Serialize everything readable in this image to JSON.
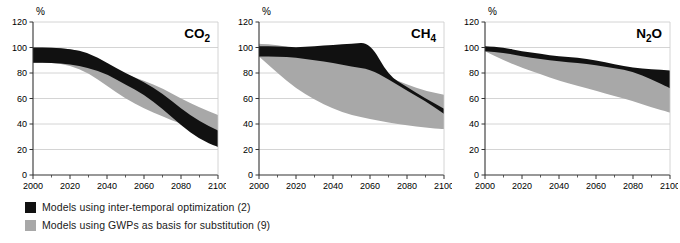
{
  "figure": {
    "axis_unit_label": "%",
    "background": "#ffffff"
  },
  "legend": {
    "position": "bottom-left",
    "items": [
      {
        "label": "Models using inter-temporal optimization (2)",
        "color": "#111111",
        "swatch_name": "legend-swatch-black"
      },
      {
        "label": "Models using GWPs as basis for substitution (9)",
        "color": "#a8a8a8",
        "swatch_name": "legend-swatch-gray"
      }
    ]
  },
  "panels": [
    {
      "id": "co2",
      "title": "CO",
      "title_sub": "2",
      "title_tail": ""
    },
    {
      "id": "ch4",
      "title": "CH",
      "title_sub": "4",
      "title_tail": ""
    },
    {
      "id": "n2o",
      "title": "N",
      "title_sub": "2",
      "title_tail": "O"
    }
  ],
  "chart_data": {
    "type": "area",
    "subtitle": "",
    "xlabel": "",
    "ylabel": "%",
    "xlim": [
      2000,
      2100
    ],
    "ylim": [
      0,
      120
    ],
    "yticks": [
      0,
      20,
      40,
      60,
      80,
      100,
      120
    ],
    "xticks": [
      2000,
      2020,
      2040,
      2060,
      2080,
      2100
    ],
    "xminorticks": [
      2010,
      2030,
      2050,
      2070,
      2090
    ],
    "grid": "horizontal",
    "legend_position": "below-plot-left",
    "colors": {
      "black_band": "#111111",
      "gray_band": "#a8a8a8",
      "grid": "#c9c9c9",
      "axis": "#333333"
    },
    "panels": [
      {
        "id": "co2",
        "label": "CO2",
        "x": [
          2000,
          2010,
          2020,
          2030,
          2040,
          2050,
          2060,
          2070,
          2080,
          2090,
          2100
        ],
        "series": [
          {
            "name": "Models using inter-temporal optimization (2)",
            "type": "band",
            "color": "#111111",
            "upper": [
              100,
              100,
              99,
              96,
              88,
              80,
              73,
              64,
              52,
              42,
              35
            ],
            "lower": [
              88,
              88,
              87,
              84,
              79,
              71,
              63,
              52,
              39,
              28,
              22
            ]
          },
          {
            "name": "Models using GWPs as basis for substitution (9)",
            "type": "band",
            "color": "#a8a8a8",
            "upper": [
              100,
              100,
              99,
              95,
              85,
              79,
              74,
              68,
              60,
              53,
              47
            ],
            "lower": [
              88,
              88,
              86,
              80,
              70,
              60,
              52,
              46,
              40,
              36,
              33
            ]
          }
        ]
      },
      {
        "id": "ch4",
        "label": "CH4",
        "x": [
          2000,
          2010,
          2020,
          2030,
          2040,
          2050,
          2060,
          2070,
          2080,
          2090,
          2100
        ],
        "series": [
          {
            "name": "Models using inter-temporal optimization (2)",
            "type": "band",
            "color": "#111111",
            "upper": [
              101,
              101,
              100,
              101,
              102,
              103,
              104,
              78,
              69,
              60,
              52
            ],
            "lower": [
              93,
              93,
              92,
              90,
              88,
              85,
              83,
              75,
              66,
              58,
              48
            ]
          },
          {
            "name": "Models using GWPs as basis for substitution (9)",
            "type": "band",
            "color": "#a8a8a8",
            "upper": [
              103,
              102,
              99,
              96,
              92,
              88,
              84,
              77,
              71,
              66,
              63
            ],
            "lower": [
              93,
              80,
              68,
              59,
              52,
              47,
              44,
              41,
              39,
              37,
              36
            ]
          }
        ]
      },
      {
        "id": "n2o",
        "label": "N2O",
        "x": [
          2000,
          2010,
          2020,
          2030,
          2040,
          2050,
          2060,
          2070,
          2080,
          2090,
          2100
        ],
        "series": [
          {
            "name": "Models using inter-temporal optimization (2)",
            "type": "band",
            "color": "#111111",
            "upper": [
              101,
              100,
              97,
              95,
              93,
              92,
              90,
              87,
              84,
              83,
              82
            ],
            "lower": [
              97,
              96,
              93,
              91,
              89,
              88,
              86,
              84,
              81,
              75,
              68
            ]
          },
          {
            "name": "Models using GWPs as basis for substitution (9)",
            "type": "band",
            "color": "#a8a8a8",
            "upper": [
              101,
              99,
              95,
              93,
              91,
              90,
              88,
              86,
              83,
              82,
              81
            ],
            "lower": [
              97,
              90,
              84,
              79,
              74,
              70,
              66,
              62,
              58,
              53,
              49
            ]
          }
        ]
      }
    ]
  }
}
